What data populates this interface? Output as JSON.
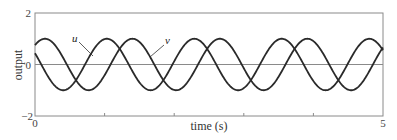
{
  "chart_data": {
    "type": "line",
    "title": "",
    "xlabel": "time (s)",
    "ylabel": "output",
    "xlim": [
      0,
      5
    ],
    "ylim": [
      -2,
      2
    ],
    "grid": false,
    "legend": "inline labels with leader lines",
    "x_tick_labels": [
      "0",
      "5"
    ],
    "x_ticks": [
      0,
      1,
      2,
      3,
      4,
      5
    ],
    "y_tick_labels": [
      "2",
      "0",
      "−2"
    ],
    "y_ticks": [
      2,
      0,
      -2
    ],
    "zero_line": true,
    "x": [
      0,
      0.25,
      0.5,
      0.75,
      1.0,
      1.25,
      1.5,
      1.75,
      2.0,
      2.25,
      2.5,
      2.75,
      3.0,
      3.25,
      3.5,
      3.75,
      4.0,
      4.25,
      4.5,
      4.75,
      5.0
    ],
    "series": [
      {
        "name": "u",
        "model": {
          "amplitude": 1.0,
          "omega": 5.0,
          "phase": 2.69
        },
        "values": [
          0.44,
          -0.71,
          -0.89,
          0.16,
          0.99,
          0.47,
          -0.69,
          -0.91,
          0.13,
          0.98,
          0.49,
          -0.68,
          -0.92,
          0.11,
          0.98,
          0.52,
          -0.65,
          -0.93,
          0.08,
          0.97,
          0.54
        ]
      },
      {
        "name": "v",
        "model": {
          "amplitude": 1.0,
          "omega": 5.0,
          "phase": 0.855
        },
        "values": [
          0.75,
          0.86,
          -0.21,
          -0.99,
          -0.41,
          0.74,
          0.87,
          -0.19,
          -0.99,
          -0.43,
          0.73,
          0.88,
          -0.17,
          -0.98,
          -0.45,
          0.71,
          0.89,
          -0.14,
          -0.98,
          -0.47,
          0.7
        ]
      }
    ],
    "annotations": [
      {
        "text": "u",
        "points_to": "u",
        "at_time": 0.83
      },
      {
        "text": "v",
        "points_to": "v",
        "at_time": 1.65
      }
    ]
  },
  "labels": {
    "y_top": "2",
    "y_zero": "0",
    "y_bottom": "−2",
    "x_left": "0",
    "x_right": "5",
    "xlabel": "time (s)",
    "ylabel": "output",
    "u": "u",
    "v": "v"
  }
}
